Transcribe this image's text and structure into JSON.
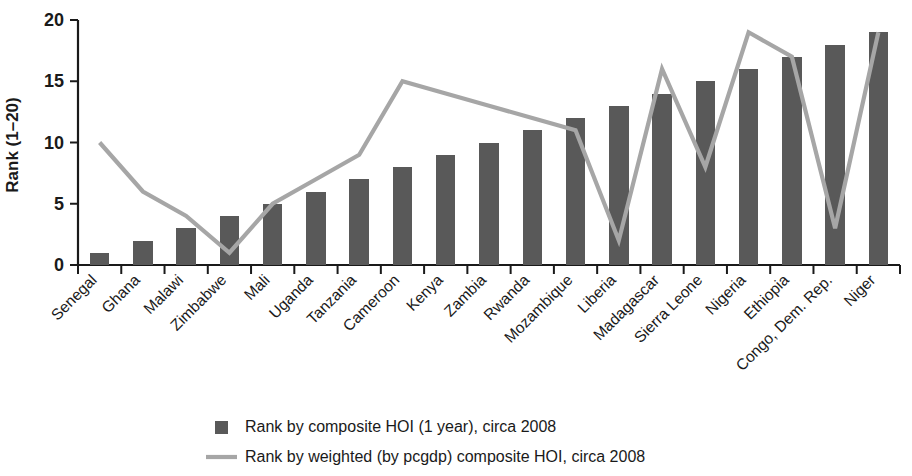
{
  "chart_data": {
    "type": "bar",
    "title": "",
    "subtitle": "",
    "xlabel": "",
    "ylabel": "Rank (1–20)",
    "ylim": [
      0,
      20
    ],
    "yticks": [
      0,
      5,
      10,
      15,
      20
    ],
    "grid": false,
    "legend_position": "bottom",
    "categories": [
      "Senegal",
      "Ghana",
      "Malawi",
      "Zimbabwe",
      "Mali",
      "Uganda",
      "Tanzania",
      "Cameroon",
      "Kenya",
      "Zambia",
      "Rwanda",
      "Mozambique",
      "Liberia",
      "Madagascar",
      "Sierra Leone",
      "Nigeria",
      "Ethiopia",
      "Congo, Dem. Rep.",
      "Niger"
    ],
    "series": [
      {
        "name": "Rank by composite HOI (1 year), circa 2008",
        "type": "bar",
        "color": "#595959",
        "values": [
          1,
          2,
          3,
          4,
          5,
          6,
          7,
          8,
          9,
          10,
          11,
          12,
          13,
          14,
          15,
          16,
          17,
          18,
          19
        ]
      },
      {
        "name": "Rank by weighted (by pcgdp) composite HOI, circa 2008",
        "type": "line",
        "color": "#a6a6a6",
        "values": [
          10,
          6,
          4,
          1,
          5,
          7,
          9,
          15,
          14,
          13,
          12,
          11,
          2,
          16,
          8,
          19,
          17,
          3,
          19
        ]
      }
    ]
  },
  "legend": {
    "items": [
      {
        "marker": "square-swatch",
        "label": "Rank by composite HOI (1 year), circa 2008",
        "color": "#595959"
      },
      {
        "marker": "line-swatch",
        "label": "Rank by weighted (by pcgdp) composite HOI, circa 2008",
        "color": "#a6a6a6"
      }
    ]
  }
}
